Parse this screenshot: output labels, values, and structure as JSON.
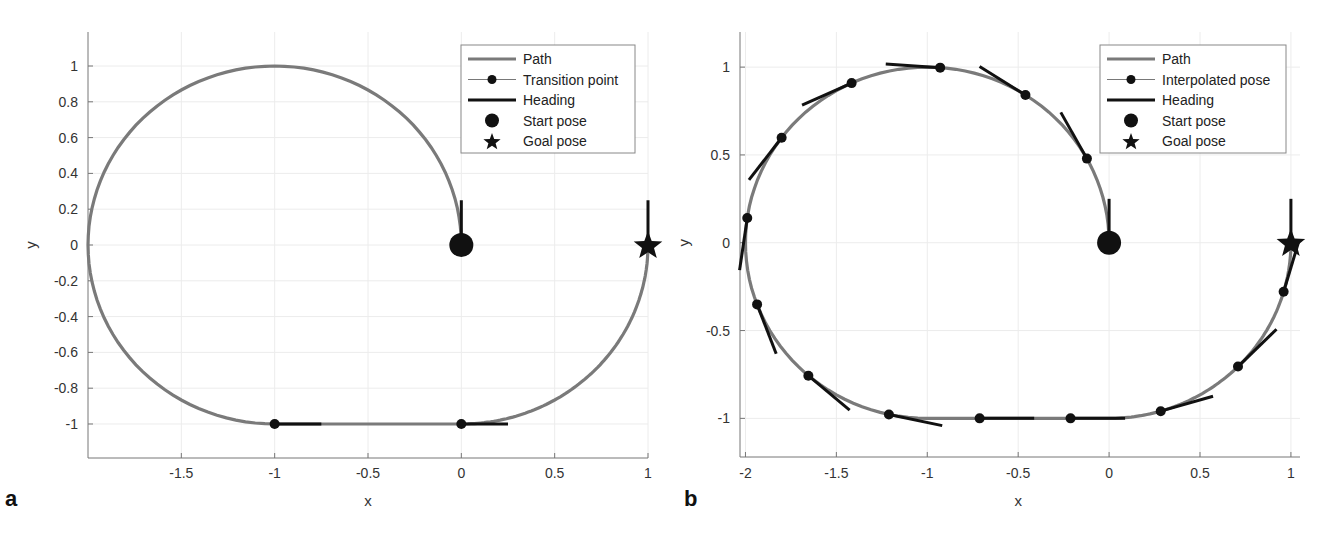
{
  "figure": {
    "panels": [
      {
        "id": "a",
        "letter": "a"
      },
      {
        "id": "b",
        "letter": "b"
      }
    ]
  },
  "colors": {
    "path": "#7a7a7a",
    "heading": "#111111",
    "marker": "#111111",
    "axis": "#777777",
    "grid": "#ececec",
    "legend_border": "#888888"
  },
  "chart_data": [
    {
      "type": "line",
      "panel": "a",
      "title": "",
      "xlabel": "x",
      "ylabel": "y",
      "xlim": [
        -2.0,
        1.0
      ],
      "ylim": [
        -1.19,
        1.19
      ],
      "grid": true,
      "legend_position": "upper right",
      "xticks": [
        -1.5,
        -1,
        -0.5,
        0,
        0.5,
        1
      ],
      "xtick_labels": [
        "-1.5",
        "-1",
        "-0.5",
        "0",
        "0.5",
        "1"
      ],
      "yticks": [
        1,
        0.8,
        0.6,
        0.4,
        0.2,
        0,
        -0.2,
        -0.4,
        -0.6,
        -0.8,
        -1
      ],
      "ytick_labels": [
        "1",
        "0.8",
        "0.6",
        "0.4",
        "0.2",
        "0",
        "-0.2",
        "-0.4",
        "-0.6",
        "-0.8",
        "-1"
      ],
      "legend": [
        "Path",
        "Transition point",
        "Heading",
        "Start pose",
        "Goal pose"
      ],
      "path_segments": [
        {
          "kind": "arc",
          "center": [
            -1,
            0
          ],
          "radius": 1,
          "start_angle_deg": 0,
          "end_angle_deg": 270
        },
        {
          "kind": "line",
          "from": [
            -1,
            -1
          ],
          "to": [
            0,
            -1
          ]
        },
        {
          "kind": "arc",
          "center": [
            0,
            0
          ],
          "radius": 1,
          "start_angle_deg": 270,
          "end_angle_deg": 360
        }
      ],
      "points": [
        {
          "x": -1,
          "y": -1,
          "heading_deg": 0
        },
        {
          "x": 0,
          "y": -1,
          "heading_deg": 0
        }
      ],
      "heading_length": 0.25,
      "start_pose": {
        "x": 0,
        "y": 0,
        "heading_deg": 90
      },
      "goal_pose": {
        "x": 1,
        "y": 0,
        "heading_deg": 90
      }
    },
    {
      "type": "line",
      "panel": "b",
      "title": "",
      "xlabel": "x",
      "ylabel": "y",
      "xlim": [
        -2.03,
        1.05
      ],
      "ylim": [
        -1.22,
        1.2
      ],
      "grid": true,
      "legend_position": "upper right",
      "xticks": [
        -2,
        -1.5,
        -1,
        -0.5,
        0,
        0.5,
        1
      ],
      "xtick_labels": [
        "-2",
        "-1.5",
        "-1",
        "-0.5",
        "0",
        "0.5",
        "1"
      ],
      "yticks": [
        1,
        0.5,
        0,
        -0.5,
        -1
      ],
      "ytick_labels": [
        "1",
        "0.5",
        "0",
        "-0.5",
        "-1"
      ],
      "legend": [
        "Path",
        "Interpolated pose",
        "Heading",
        "Start pose",
        "Goal pose"
      ],
      "path_segments": [
        {
          "kind": "arc",
          "center": [
            -1,
            0
          ],
          "radius": 1,
          "start_angle_deg": 0,
          "end_angle_deg": 270
        },
        {
          "kind": "line",
          "from": [
            -1,
            -1
          ],
          "to": [
            0,
            -1
          ]
        },
        {
          "kind": "arc",
          "center": [
            0,
            0
          ],
          "radius": 1,
          "start_angle_deg": 270,
          "end_angle_deg": 360
        }
      ],
      "points": [
        {
          "x": -0.122,
          "y": 0.479,
          "heading_deg": 118.6
        },
        {
          "x": -0.46,
          "y": 0.841,
          "heading_deg": 147.3
        },
        {
          "x": -0.929,
          "y": 0.997,
          "heading_deg": 175.9
        },
        {
          "x": -1.416,
          "y": 0.909,
          "heading_deg": 204.6
        },
        {
          "x": -1.801,
          "y": 0.598,
          "heading_deg": 233.2
        },
        {
          "x": -1.99,
          "y": 0.141,
          "heading_deg": 261.9
        },
        {
          "x": -1.936,
          "y": -0.351,
          "heading_deg": 290.5
        },
        {
          "x": -1.654,
          "y": -0.757,
          "heading_deg": 319.2
        },
        {
          "x": -1.211,
          "y": -0.978,
          "heading_deg": 347.8
        },
        {
          "x": -0.712,
          "y": -1.0,
          "heading_deg": 0
        },
        {
          "x": -0.212,
          "y": -1.0,
          "heading_deg": 0
        },
        {
          "x": 0.284,
          "y": -0.959,
          "heading_deg": 16.5
        },
        {
          "x": 0.709,
          "y": -0.705,
          "heading_deg": 45.1
        },
        {
          "x": 0.96,
          "y": -0.279,
          "heading_deg": 73.8
        }
      ],
      "heading_length": 0.3,
      "start_pose": {
        "x": 0,
        "y": 0,
        "heading_deg": 90
      },
      "goal_pose": {
        "x": 1,
        "y": 0,
        "heading_deg": 90
      }
    }
  ]
}
